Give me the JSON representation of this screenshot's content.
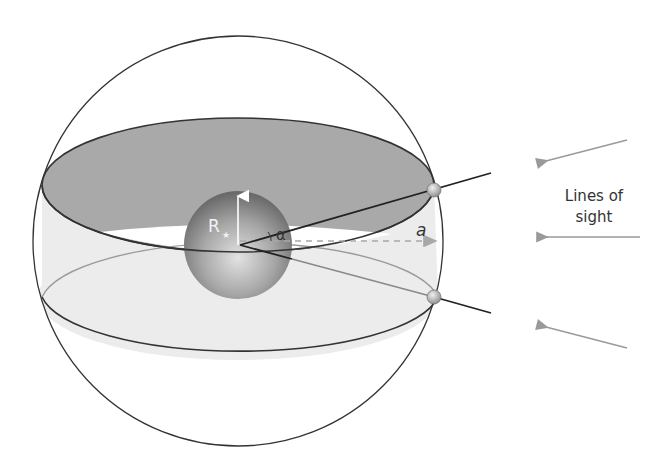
{
  "diagram": {
    "labels": {
      "star_radius": "R",
      "star_radius_sub": "★",
      "angle": "α",
      "semi_major_axis": "a",
      "lines_of_sight_line1": "Lines of",
      "lines_of_sight_line2": "sight"
    },
    "elements": {
      "celestial_sphere": "outer-circle",
      "star": "central-sphere",
      "orbit_upper": "dark-orbit-plane",
      "orbit_lower": "light-orbit-plane",
      "planet_markers": 2,
      "sight_arrows": 3
    },
    "colors": {
      "outline": "#333333",
      "upper_plane": "#a9a9a9",
      "lower_plane": "#ececec",
      "star_dark": "#707070",
      "star_light": "#d8d8d8",
      "arrow": "#9a9a9a",
      "dashed": "#a8a8a8",
      "text": "#333333"
    }
  }
}
